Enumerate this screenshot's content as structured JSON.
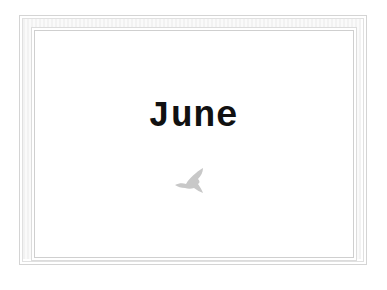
{
  "card": {
    "title": "June",
    "icon": "bird-icon",
    "colors": {
      "frame": "#d4d4d4",
      "title": "#111111",
      "bird": "#c8c8c8"
    }
  }
}
